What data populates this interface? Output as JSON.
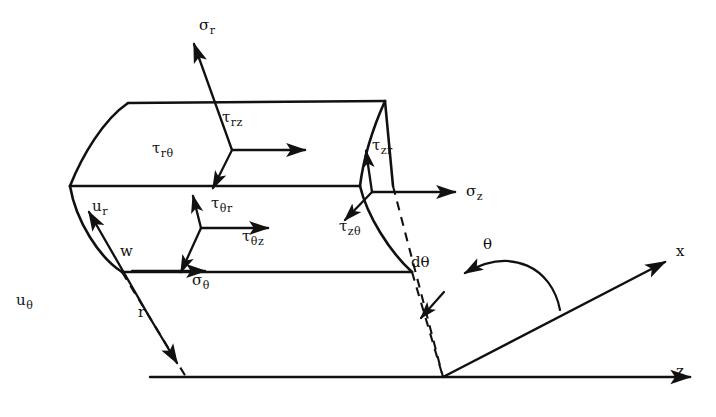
{
  "figure": {
    "background_color": "#ffffff",
    "line_color": "#111111"
  },
  "axes": [
    {
      "name": "z-axis",
      "label": "z",
      "direction": "horizontal-right"
    },
    {
      "name": "x-axis",
      "label": "x",
      "direction": "up-right"
    }
  ],
  "angles": [
    {
      "name": "theta-angle",
      "label": "θ"
    },
    {
      "name": "d-theta-angle",
      "label": "dθ"
    }
  ],
  "radial_face": {
    "name": "r-face-triad",
    "components": [
      {
        "key": "sigma_r",
        "base": "σ",
        "sub": "r",
        "label": "σr"
      },
      {
        "key": "tau_rz",
        "base": "τ",
        "sub": "rz",
        "label": "τrz"
      },
      {
        "key": "tau_rtheta",
        "base": "τ",
        "sub": "rθ",
        "label": "τrθ"
      }
    ]
  },
  "theta_face": {
    "name": "theta-face-triad",
    "components": [
      {
        "key": "tau_thetar",
        "base": "τ",
        "sub": "θr",
        "label": "τθr"
      },
      {
        "key": "tau_thetaz",
        "base": "τ",
        "sub": "θz",
        "label": "τθz"
      },
      {
        "key": "sigma_theta",
        "base": "σ",
        "sub": "θ",
        "label": "σθ"
      }
    ]
  },
  "z_face": {
    "name": "z-face-triad",
    "components": [
      {
        "key": "tau_zr",
        "base": "τ",
        "sub": "zr",
        "label": "τzr"
      },
      {
        "key": "tau_ztheta",
        "base": "τ",
        "sub": "zθ",
        "label": "τzθ"
      },
      {
        "key": "sigma_z",
        "base": "σ",
        "sub": "z",
        "label": "σz"
      }
    ]
  },
  "displacements": [
    {
      "key": "u_r",
      "base": "u",
      "sub": "r",
      "label": "ur"
    },
    {
      "key": "u_theta",
      "base": "u",
      "sub": "θ",
      "label": "uθ"
    },
    {
      "key": "w",
      "base": "w",
      "sub": "",
      "label": "w"
    }
  ],
  "radius": {
    "key": "r",
    "base": "r",
    "sub": "",
    "label": "r"
  }
}
